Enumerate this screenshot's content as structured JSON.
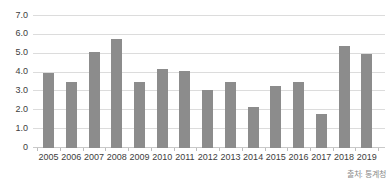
{
  "chart_data": {
    "type": "bar",
    "title": "",
    "xlabel": "",
    "ylabel": "",
    "categories": [
      "2005",
      "2006",
      "2007",
      "2008",
      "2009",
      "2010",
      "2011",
      "2012",
      "2013",
      "2014",
      "2015",
      "2016",
      "2017",
      "2018",
      "2019"
    ],
    "values": [
      4.0,
      3.5,
      5.1,
      5.8,
      3.5,
      4.2,
      4.1,
      3.1,
      3.5,
      2.2,
      3.3,
      3.5,
      1.8,
      5.4,
      5.0
    ],
    "ylim": [
      0,
      7
    ],
    "ytick_step": 1,
    "ytick_labels": [
      "0",
      "1.0",
      "2.0",
      "3.0",
      "4.0",
      "5.0",
      "6.0",
      "7.0"
    ],
    "grid": true,
    "legend": "none",
    "source": "출처: 통계청",
    "bar_color": "#8c8c8c",
    "gridline_color": "#dcdcdc",
    "label_color": "#3d3d3d",
    "source_color": "#8a8a8a",
    "background_color": "#ffffff"
  }
}
